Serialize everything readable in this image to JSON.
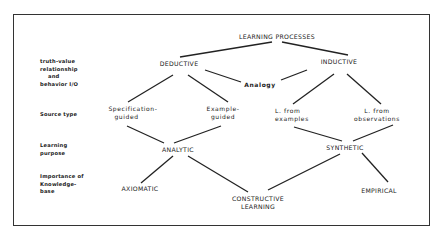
{
  "diagram": {
    "title": "LEARNING PROCESSES",
    "row_labels": [
      {
        "lines": [
          "truth-value",
          "relationship",
          "and",
          "behavior I/O"
        ]
      },
      {
        "lines": [
          "Source type"
        ]
      },
      {
        "lines": [
          "Learning",
          "purpose"
        ]
      },
      {
        "lines": [
          "Importance of",
          "Knowledge-",
          "base"
        ]
      }
    ],
    "nodes": {
      "root": {
        "label": "LEARNING PROCESSES"
      },
      "deductive": {
        "label": "DEDUCTIVE"
      },
      "inductive": {
        "label": "INDUCTIVE"
      },
      "analogy": {
        "label": "Analogy"
      },
      "specification_guided": {
        "lines": [
          "Specification-",
          "guided"
        ]
      },
      "example_guided": {
        "lines": [
          "Example-",
          "guided"
        ]
      },
      "l_from_examples": {
        "lines": [
          "L. from",
          "examples"
        ]
      },
      "l_from_observations": {
        "lines": [
          "L. from",
          "observations"
        ]
      },
      "analytic": {
        "label": "ANALYTIC"
      },
      "synthetic": {
        "label": "SYNTHETIC"
      },
      "axiomatic": {
        "label": "AXIOMATIC"
      },
      "constructive_learning": {
        "lines": [
          "CONSTRUCTIVE",
          "LEARNING"
        ]
      },
      "empirical": {
        "label": "EMPIRICAL"
      }
    },
    "edges": [
      [
        "root",
        "deductive"
      ],
      [
        "root",
        "inductive"
      ],
      [
        "deductive",
        "analogy"
      ],
      [
        "inductive",
        "analogy"
      ],
      [
        "deductive",
        "specification_guided"
      ],
      [
        "deductive",
        "example_guided"
      ],
      [
        "inductive",
        "l_from_examples"
      ],
      [
        "inductive",
        "l_from_observations"
      ],
      [
        "specification_guided",
        "analytic"
      ],
      [
        "example_guided",
        "analytic"
      ],
      [
        "l_from_examples",
        "synthetic"
      ],
      [
        "l_from_observations",
        "synthetic"
      ],
      [
        "analytic",
        "axiomatic"
      ],
      [
        "analytic",
        "constructive_learning"
      ],
      [
        "synthetic",
        "constructive_learning"
      ],
      [
        "synthetic",
        "empirical"
      ]
    ]
  }
}
